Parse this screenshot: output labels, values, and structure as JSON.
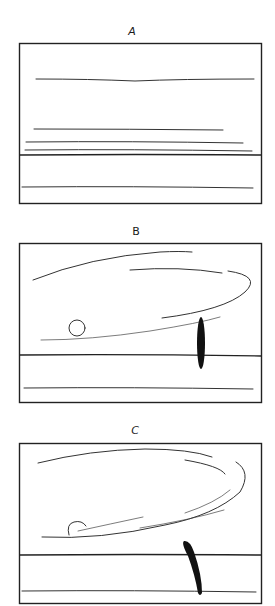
{
  "panels": [
    {
      "id": "A",
      "label": "A"
    },
    {
      "id": "B",
      "label": "B"
    },
    {
      "id": "C",
      "label": "C"
    }
  ],
  "colors": {
    "ink": "#222222",
    "paper": "#ffffff"
  }
}
